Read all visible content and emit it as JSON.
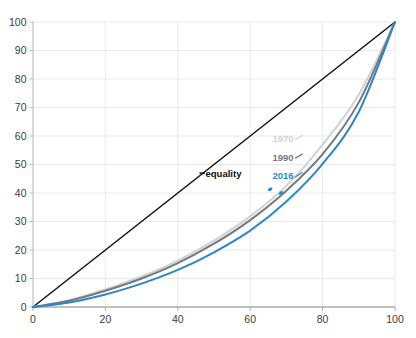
{
  "chart_data": {
    "type": "line",
    "title": "",
    "subtitle": "",
    "xlabel": "",
    "ylabel": "",
    "xlim": [
      0,
      100
    ],
    "ylim": [
      0,
      100
    ],
    "grid": true,
    "legend_position": "inline-right",
    "x_ticks": [
      0,
      20,
      40,
      60,
      80,
      100
    ],
    "y_ticks": [
      0,
      10,
      20,
      30,
      40,
      50,
      60,
      70,
      80,
      90,
      100
    ],
    "x_tick_labels": [
      "0",
      "20",
      "40",
      "60",
      "80",
      "100"
    ],
    "y_tick_labels": [
      "0",
      "10",
      "20",
      "30",
      "40",
      "50",
      "60",
      "70",
      "80",
      "90",
      "100"
    ],
    "x": [
      0,
      10,
      20,
      30,
      40,
      50,
      60,
      70,
      80,
      90,
      100
    ],
    "series": [
      {
        "name": "equality",
        "label": "equality",
        "color": "#111111",
        "values": [
          0,
          10,
          20,
          30,
          40,
          50,
          60,
          70,
          80,
          90,
          100
        ],
        "label_x": 46,
        "label_y": 47
      },
      {
        "name": "1970",
        "label": "1970",
        "color": "#cfd2d4",
        "values": [
          0,
          2.4,
          6.2,
          10.7,
          16.3,
          23.3,
          31.8,
          42.5,
          57.0,
          74.5,
          100
        ],
        "label_x": 72,
        "label_y": 59
      },
      {
        "name": "1990",
        "label": "1990",
        "color": "#77787b",
        "values": [
          0,
          2.2,
          5.7,
          10.0,
          15.4,
          22.2,
          30.5,
          40.8,
          53.6,
          71.8,
          100
        ],
        "label_x": 72,
        "label_y": 52.5
      },
      {
        "name": "2016",
        "label": "2016",
        "color": "#2f86c5",
        "values": [
          0,
          1.6,
          4.4,
          8.2,
          13.0,
          19.2,
          26.8,
          37.0,
          50.2,
          68.5,
          100
        ],
        "label_x": 72,
        "label_y": 46
      }
    ],
    "annotations": [
      {
        "name": "marker-1970-1990",
        "x": 65.5,
        "y": 41.3,
        "color": "#2f86c5"
      },
      {
        "name": "marker-1990-2016",
        "x": 68.5,
        "y": 40.0,
        "color": "#2f86c5"
      }
    ]
  }
}
